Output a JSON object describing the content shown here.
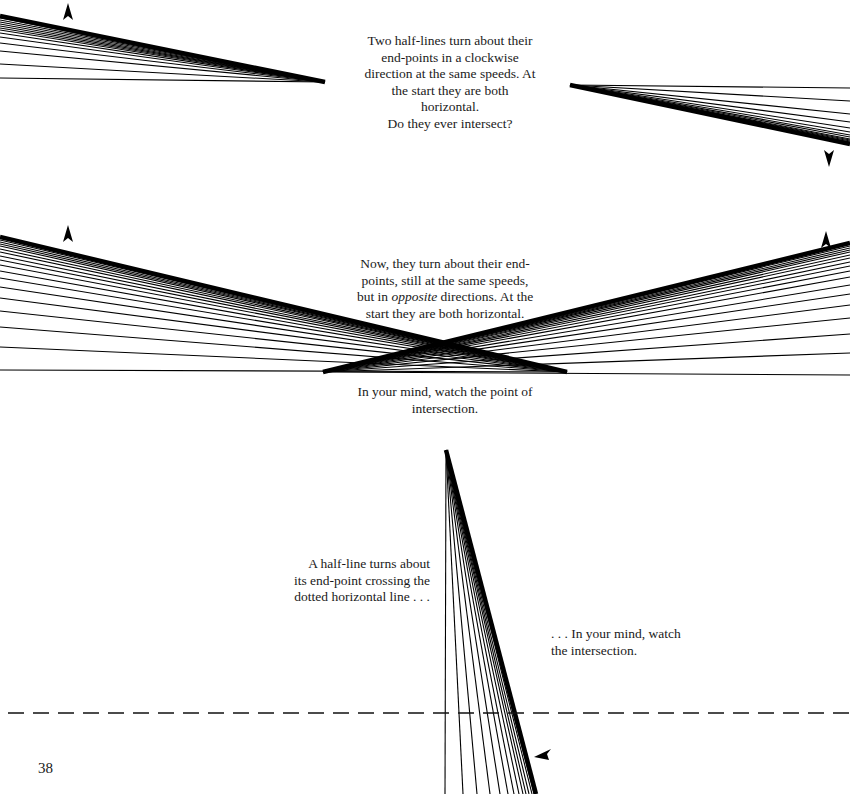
{
  "page": {
    "page_number": "38",
    "background": "#ffffff",
    "ink": "#000000"
  },
  "captions": {
    "clockwise": "Two half-lines turn about their\nend-points in a clockwise\ndirection at the same speeds. At\nthe start they are both\nhorizontal.\nDo they ever intersect?",
    "opposite_line1": "Now, they turn about their end-\npoints, still at the same speeds,\nbut in ",
    "opposite_italic": "opposite",
    "opposite_line2": " directions. At the\nstart they are both horizontal.",
    "watch_point": "In your mind, watch the point of\nintersection.",
    "half_line": "A half-line turns about\nits end-point crossing the\ndotted horizontal line  . . .",
    "watch_intersection": ". . . In your mind, watch\nthe intersection."
  },
  "figures": {
    "fig1_left_fan": {
      "pivot": [
        325,
        82
      ],
      "end_x": 0,
      "end_ys": [
        78,
        64,
        51,
        43,
        37,
        33,
        30,
        28,
        26,
        24,
        22,
        20,
        18,
        17,
        16
      ]
    },
    "fig1_right_fan": {
      "pivot": [
        570,
        85
      ],
      "end_x": 850,
      "end_ys": [
        88,
        101,
        114,
        122,
        128,
        132,
        135,
        137,
        139,
        140,
        141,
        142,
        143,
        144
      ]
    },
    "fig2_left_fan": {
      "pivot": [
        567,
        372
      ],
      "end_x": 0,
      "end_ys": [
        370,
        347,
        327,
        311,
        298,
        287,
        278,
        271,
        265,
        260,
        256,
        252,
        249,
        246,
        244,
        242,
        240,
        238,
        237
      ]
    },
    "fig2_right_fan": {
      "pivot": [
        323,
        372
      ],
      "end_x": 850,
      "end_ys": [
        375,
        353,
        334,
        318,
        305,
        294,
        285,
        277,
        271,
        266,
        262,
        258,
        255,
        252,
        250,
        248,
        246,
        244,
        243
      ]
    },
    "fig3_vertical_fan": {
      "pivot": [
        446,
        450
      ],
      "end_y": 794,
      "end_xs": [
        445,
        463,
        477,
        490,
        500,
        508,
        514,
        519,
        523,
        526,
        529,
        532,
        534,
        536
      ]
    },
    "dashed_line": {
      "y": 713,
      "x1": 8,
      "x2": 850,
      "dash": "16 9"
    },
    "arrows": [
      {
        "name": "fig1-left-arrow",
        "x": 68,
        "y": 12,
        "dir": "up"
      },
      {
        "name": "fig1-right-arrow",
        "x": 829,
        "y": 158,
        "dir": "down"
      },
      {
        "name": "fig2-left-arrow",
        "x": 68,
        "y": 234,
        "dir": "up"
      },
      {
        "name": "fig2-right-arrow",
        "x": 826,
        "y": 240,
        "dir": "up"
      },
      {
        "name": "fig3-arrow",
        "x": 543,
        "y": 754,
        "dir": "left-down"
      }
    ]
  }
}
